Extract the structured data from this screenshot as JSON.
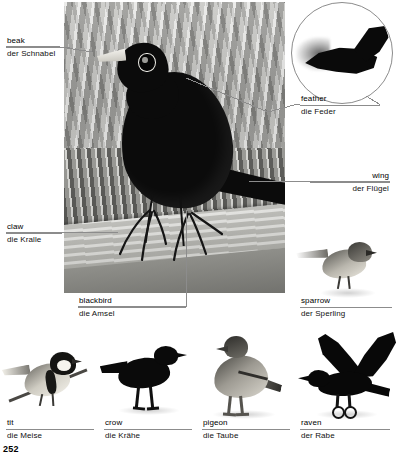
{
  "page": {
    "number": "252",
    "topic": "birds"
  },
  "main_photo": {
    "name": "blackbird-photo",
    "caption": {
      "en": "blackbird",
      "de": "die Amsel"
    }
  },
  "inset": {
    "name": "feather-closeup",
    "shape": "circle"
  },
  "callouts": [
    {
      "id": "beak",
      "en": "beak",
      "de": "der Schnabel",
      "align": "left"
    },
    {
      "id": "claw",
      "en": "claw",
      "de": "die Kralle",
      "align": "left"
    },
    {
      "id": "feather",
      "en": "feather",
      "de": "die Feder",
      "align": "left"
    },
    {
      "id": "wing",
      "en": "wing",
      "de": "der Flügel",
      "align": "right"
    }
  ],
  "species": [
    {
      "id": "sparrow",
      "en": "sparrow",
      "de": "der Sperling"
    },
    {
      "id": "tit",
      "en": "tit",
      "de": "die Meise"
    },
    {
      "id": "crow",
      "en": "crow",
      "de": "die Krähe"
    },
    {
      "id": "pigeon",
      "en": "pigeon",
      "de": "die Taube"
    },
    {
      "id": "raven",
      "en": "raven",
      "de": "der Rabe"
    }
  ],
  "colors": {
    "background": "#ffffff",
    "rule": "#8c8c8c",
    "text": "#000000",
    "bird_black": "#0a0a0a"
  }
}
